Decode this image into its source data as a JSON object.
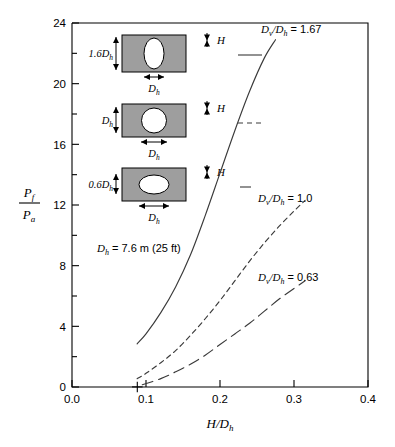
{
  "chart_data": {
    "type": "line",
    "title": "",
    "xlabel": "H/Dh",
    "ylabel": "Pf/Pa",
    "xlim": [
      0.0,
      0.4
    ],
    "ylim": [
      0,
      24
    ],
    "xticks": [
      "0.0",
      "0.1",
      "0.2",
      "0.3",
      "0.4"
    ],
    "yticks": [
      "0",
      "4",
      "8",
      "12",
      "16",
      "20",
      "24"
    ],
    "xtick_values": [
      0.0,
      0.1,
      0.2,
      0.3,
      0.4
    ],
    "ytick_values": [
      0,
      4,
      8,
      12,
      16,
      20,
      24
    ],
    "minor_ytick_values": [
      2,
      6,
      10,
      14,
      18,
      22
    ],
    "grid": false,
    "legend_position": "inline-annotations",
    "annotations": [
      {
        "name": "note-dh",
        "text": "Dh = 7.6 m (25 ft)",
        "x": 0.035,
        "y": 9.2
      },
      {
        "name": "curve-label-167",
        "text": "Dv /Dh = 1.67",
        "x": 0.255,
        "y": 23.0
      },
      {
        "name": "curve-label-10",
        "text": "Dv /Dh  = 1.0",
        "x": 0.255,
        "y": 12.3
      },
      {
        "name": "curve-label-063",
        "text": "Dv /Dh = 0.63",
        "x": 0.255,
        "y": 7.1
      }
    ],
    "series": [
      {
        "name": "Dv/Dh = 1.67",
        "label": "Dv /Dh = 1.67",
        "style": "solid",
        "points": [
          [
            0.088,
            2.85
          ],
          [
            0.1,
            3.5
          ],
          [
            0.12,
            4.9
          ],
          [
            0.14,
            6.6
          ],
          [
            0.16,
            8.7
          ],
          [
            0.18,
            11.3
          ],
          [
            0.2,
            14.1
          ],
          [
            0.22,
            16.9
          ],
          [
            0.24,
            19.5
          ],
          [
            0.26,
            21.7
          ],
          [
            0.275,
            22.9
          ]
        ]
      },
      {
        "name": "Dv/Dh = 1.0",
        "label": "Dv /Dh  = 1.0",
        "style": "short-dash",
        "points": [
          [
            0.088,
            0.55
          ],
          [
            0.1,
            0.9
          ],
          [
            0.12,
            1.6
          ],
          [
            0.14,
            2.4
          ],
          [
            0.16,
            3.4
          ],
          [
            0.18,
            4.5
          ],
          [
            0.2,
            5.7
          ],
          [
            0.22,
            7.0
          ],
          [
            0.24,
            8.3
          ],
          [
            0.26,
            9.5
          ],
          [
            0.28,
            10.6
          ],
          [
            0.3,
            11.6
          ],
          [
            0.315,
            12.3
          ]
        ]
      },
      {
        "name": "Dv/Dh = 0.63",
        "label": "Dv /Dh = 0.63",
        "style": "long-dash",
        "points": [
          [
            0.095,
            0.15
          ],
          [
            0.12,
            0.55
          ],
          [
            0.14,
            1.0
          ],
          [
            0.16,
            1.5
          ],
          [
            0.18,
            2.1
          ],
          [
            0.2,
            2.8
          ],
          [
            0.22,
            3.5
          ],
          [
            0.24,
            4.2
          ],
          [
            0.26,
            5.0
          ],
          [
            0.28,
            5.8
          ],
          [
            0.3,
            6.5
          ],
          [
            0.315,
            7.0
          ]
        ]
      }
    ],
    "marker": {
      "name": "plus-marker",
      "symbol": "+",
      "x": 0.095,
      "y": 0.35
    }
  },
  "axis": {
    "y_label_numerator": "P",
    "y_label_numerator_sub": "f",
    "y_label_denominator": "P",
    "y_label_denominator_sub": "a",
    "x_label_main": "H/D",
    "x_label_sub": "h"
  },
  "insets": [
    {
      "name": "inset-tall-ellipse",
      "vertical_label": "1.6D",
      "vertical_label_sub": "h",
      "horizontal_label": "D",
      "horizontal_label_sub": "h",
      "h_label": "H",
      "shape": "tall-ellipse",
      "ratio": 1.67,
      "legend_style": "solid"
    },
    {
      "name": "inset-circle",
      "vertical_label": "D",
      "vertical_label_sub": "h",
      "horizontal_label": "D",
      "horizontal_label_sub": "h",
      "h_label": "H",
      "shape": "circle",
      "ratio": 1.0,
      "legend_style": "short-dash"
    },
    {
      "name": "inset-wide-ellipse",
      "vertical_label": "0.6D",
      "vertical_label_sub": "h",
      "horizontal_label": "D",
      "horizontal_label_sub": "h",
      "h_label": "H",
      "shape": "wide-ellipse",
      "ratio": 0.63,
      "legend_style": "long-dash"
    }
  ],
  "note": {
    "dh_text": "D",
    "dh_sub": "h",
    "dh_value": " = 7.6 m (25 ft)"
  },
  "curve_labels": {
    "solid_main": "D",
    "solid_sub": "v",
    "solid_rest": "/D",
    "solid_sub2": "h",
    "solid_value": " = 1.67",
    "dash_value": "  = 1.0",
    "longdash_value": " = 0.63"
  },
  "colors": {
    "axis": "#000000",
    "curve": "#3a3a3a",
    "inset_fill": "#9e9e9e",
    "inset_stroke": "#000000",
    "background": "#ffffff"
  }
}
